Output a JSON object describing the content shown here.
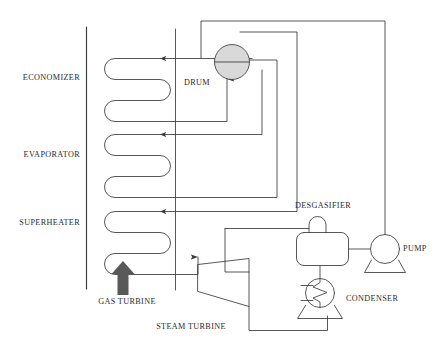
{
  "diagram": {
    "type": "process-flow-diagram",
    "colors": {
      "line": "#3a3a3a",
      "drum_fill": "#d9d9d9",
      "gas_arrow_fill": "#595959",
      "text": "#2b2b2b",
      "background": "#ffffff"
    },
    "labels": {
      "economizer": "ECONOMIZER",
      "evaporator": "EVAPORATOR",
      "superheater": "SUPERHEATER",
      "drum": "DRUM",
      "gas_turbine": "GAS TURBINE",
      "steam_turbine": "STEAM TURBINE",
      "desgasifier": "DESGASIFIER",
      "condenser": "CONDENSER",
      "pump": "PUMP"
    },
    "sections": [
      {
        "name": "economizer",
        "label": "ECONOMIZER",
        "passes": 3,
        "order": 1
      },
      {
        "name": "evaporator",
        "label": "EVAPORATOR",
        "passes": 3,
        "order": 2
      },
      {
        "name": "superheater",
        "label": "SUPERHEATER",
        "passes": 3,
        "order": 3
      }
    ],
    "equipment": [
      {
        "name": "steam-drum",
        "label": "DRUM",
        "shape": "circle-with-waterline",
        "filled": true
      },
      {
        "name": "steam-turbine",
        "label": "STEAM TURBINE",
        "shape": "trapezoid"
      },
      {
        "name": "desgasifier",
        "label": "DESGASIFIER",
        "shape": "rounded-rect-with-dome"
      },
      {
        "name": "condenser",
        "label": "CONDENSER",
        "shape": "circle-with-zigzag-coil"
      },
      {
        "name": "feedwater-pump",
        "label": "PUMP",
        "shape": "circle-on-trapezoid-base"
      },
      {
        "name": "gas-turbine-exhaust",
        "label": "GAS TURBINE",
        "shape": "block-arrow-up"
      }
    ]
  }
}
